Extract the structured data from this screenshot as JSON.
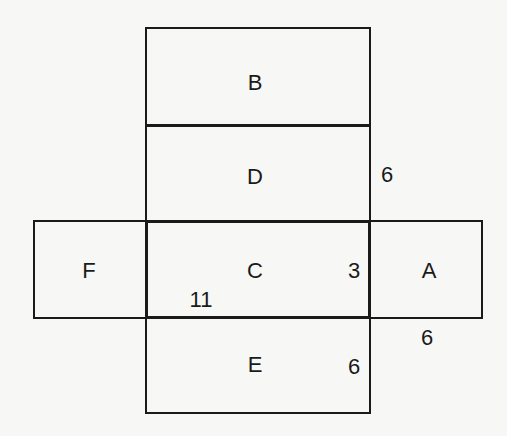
{
  "diagram": {
    "type": "cube-net",
    "faces": [
      {
        "id": "B",
        "label": "B"
      },
      {
        "id": "D",
        "label": "D"
      },
      {
        "id": "F",
        "label": "F"
      },
      {
        "id": "C",
        "label": "C"
      },
      {
        "id": "A",
        "label": "A"
      },
      {
        "id": "E",
        "label": "E"
      }
    ],
    "dimensions": [
      {
        "id": "d1",
        "label": "6",
        "near": "right edge of D"
      },
      {
        "id": "d2",
        "label": "3",
        "near": "right side of C"
      },
      {
        "id": "d3",
        "label": "11",
        "near": "bottom-left of C"
      },
      {
        "id": "d4",
        "label": "6",
        "near": "below A"
      },
      {
        "id": "d5",
        "label": "6",
        "near": "right side of E"
      }
    ],
    "line_color": "#1a1a1a",
    "background": "#f7f7f5"
  }
}
